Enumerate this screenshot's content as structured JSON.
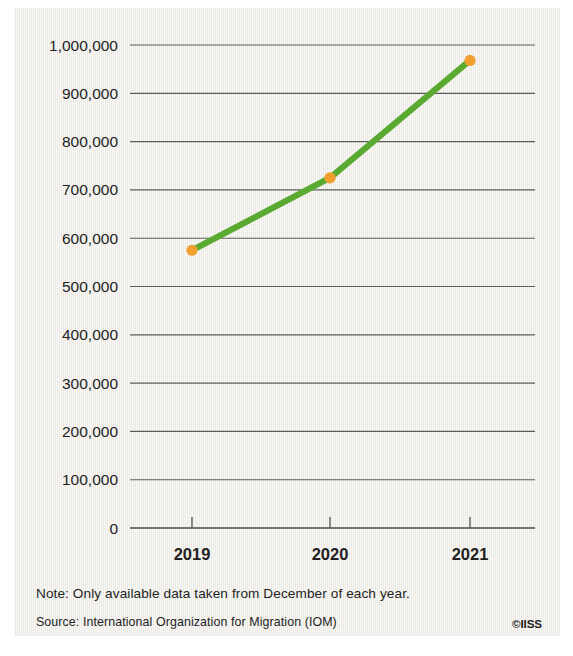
{
  "chart_data": {
    "type": "line",
    "title": "",
    "subtitle": "",
    "xlabel": "",
    "ylabel": "",
    "categories": [
      "2019",
      "2020",
      "2021"
    ],
    "x": [
      2019,
      2020,
      2021
    ],
    "values": [
      575000,
      725000,
      968000
    ],
    "series": [
      {
        "name": "Migrants",
        "values": [
          575000,
          725000,
          968000
        ],
        "line_color": "#5aaa32",
        "marker_color": "#f0a030"
      }
    ],
    "ylim": [
      0,
      1000000
    ],
    "yticks": [
      0,
      100000,
      200000,
      300000,
      400000,
      500000,
      600000,
      700000,
      800000,
      900000,
      1000000
    ],
    "ytick_labels": [
      "0",
      "100,000",
      "200,000",
      "300,000",
      "400,000",
      "500,000",
      "600,000",
      "700,000",
      "800,000",
      "900,000",
      "1,000,000"
    ],
    "xticks": [
      "2019",
      "2020",
      "2021"
    ],
    "grid": true,
    "grid_axis": "y",
    "legend": false,
    "legend_position": "none",
    "annotations": []
  },
  "footer": {
    "note": "Note: Only available data taken from December of each year.",
    "source": "Source: International Organization for Migration (IOM)",
    "credit": "©IISS"
  },
  "colors": {
    "background": "#eeece6",
    "page": "#ffffff",
    "line": "#5aaa32",
    "marker": "#f0a030",
    "text": "#231f1e",
    "grid": "#5c5c58"
  }
}
